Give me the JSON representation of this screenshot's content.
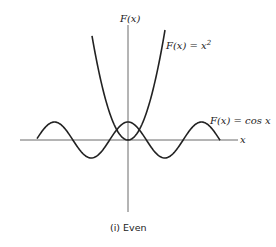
{
  "chart_data": {
    "type": "line",
    "title": "",
    "caption": "(i) Even",
    "xlabel": "x",
    "ylabel": "F(x)",
    "grid": false,
    "axes": "centered",
    "series": [
      {
        "name": "F(x) = x²",
        "function": "x^2",
        "label": "F(x) = x²"
      },
      {
        "name": "F(x) = cos x",
        "function": "cos x",
        "label": "F(x) = cos x",
        "x_range": [
          -2.5,
          2.5
        ],
        "periods_shown": "peaks at x=-2π,0,2π (scaled); troughs at ±π"
      }
    ]
  },
  "labels": {
    "y_axis": "F(x)",
    "x_axis": "x",
    "parabola": "F(x) = x²",
    "cosine": "F(x) = cos x",
    "caption": "(i) Even"
  }
}
